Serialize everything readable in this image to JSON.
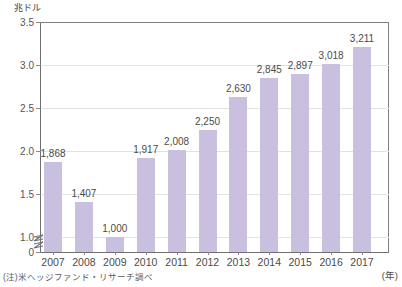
{
  "chart_data": {
    "type": "bar",
    "title": "",
    "subtitle": "",
    "unit_label": "兆ドル",
    "xlabel": "(年)",
    "ylabel": "",
    "categories": [
      "2007",
      "2008",
      "2009",
      "2010",
      "2011",
      "2012",
      "2013",
      "2014",
      "2015",
      "2016",
      "2017"
    ],
    "values": [
      1.868,
      1.407,
      1.0,
      1.917,
      2.008,
      2.25,
      2.63,
      2.845,
      2.897,
      3.018,
      3.211
    ],
    "value_labels": [
      "1,868",
      "1,407",
      "1,000",
      "1,917",
      "2,008",
      "2,250",
      "2,630",
      "2,845",
      "2,897",
      "3,018",
      "3,211"
    ],
    "ylim": [
      0,
      3.5
    ],
    "y_ticks": [
      "0",
      "1.0",
      "1.5",
      "2.0",
      "2.5",
      "3.0",
      "3.5"
    ],
    "y_tick_values": [
      0,
      1.0,
      1.5,
      2.0,
      2.5,
      3.0,
      3.5
    ],
    "axis_break": true,
    "axis_break_between": [
      0,
      1.0
    ],
    "grid": true,
    "grid_axis": "y",
    "legend": "none",
    "bar_color": "#c9c0e0",
    "axis_color": "#6f6f6f",
    "grid_color": "#e2e2e2",
    "text_color": "#4b4b4b"
  },
  "footnote": {
    "text": "(注)米ヘッジファンド・リサーチ調べ"
  }
}
